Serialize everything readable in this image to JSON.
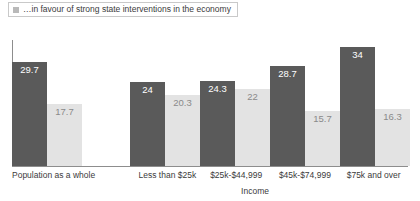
{
  "legend": {
    "marker": "legend-square-marker",
    "label": "…in favour of strong state interventions in the economy"
  },
  "colors": {
    "series_dark": "#5a5a5a",
    "series_light": "#e3e3e3",
    "axis": "#8d8d8d",
    "text": "#3b3b3b",
    "legend_marker": "#b9b9b9"
  },
  "chart_data": {
    "type": "bar",
    "title": "",
    "subtitle": "",
    "xlabel": "Income",
    "ylabel": "",
    "ylim": [
      0,
      36
    ],
    "grid": false,
    "legend_position": "top-left",
    "categories": [
      "Population as a whole",
      "Less than $25k",
      "$25k-$44,999",
      "$45k-$74,999",
      "$75k and over"
    ],
    "series": [
      {
        "name": "…in favour of strong state interventions in the economy",
        "color": "#5a5a5a",
        "values": [
          29.7,
          24,
          24.3,
          28.7,
          34
        ]
      },
      {
        "name": "second-series",
        "color": "#e3e3e3",
        "values": [
          17.7,
          20.3,
          22,
          15.7,
          16.3
        ]
      }
    ],
    "value_labels": [
      [
        "29.7",
        "17.7"
      ],
      [
        "24",
        "20.3"
      ],
      [
        "24.3",
        "22"
      ],
      [
        "28.7",
        "15.7"
      ],
      [
        "34",
        "16.3"
      ]
    ]
  }
}
